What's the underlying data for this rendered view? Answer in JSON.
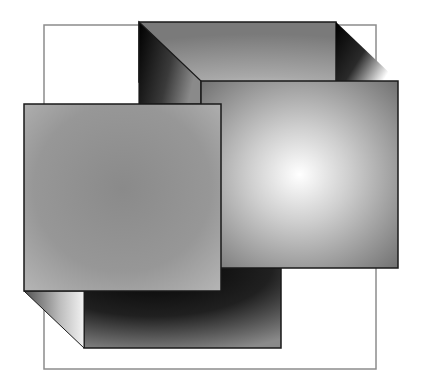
{
  "figure": {
    "width": 422,
    "height": 390,
    "background": "#ffffff",
    "stroke_color": "#1a1a1a",
    "outline_color": "#8c8c8c",
    "shapes": {
      "outline_rect": {
        "x": 44,
        "y": 25,
        "w": 332,
        "h": 344
      },
      "back_face": {
        "x": 139,
        "y": 22,
        "w": 197,
        "h": 60
      },
      "right_square": {
        "x": 201,
        "y": 81,
        "w": 197,
        "h": 187,
        "highlight_cx": 300,
        "highlight_cy": 175
      },
      "left_square": {
        "x": 24,
        "y": 104,
        "w": 197,
        "h": 187
      },
      "bottom_box": {
        "x": 84,
        "y": 291,
        "w": 197,
        "h": 57
      }
    }
  }
}
